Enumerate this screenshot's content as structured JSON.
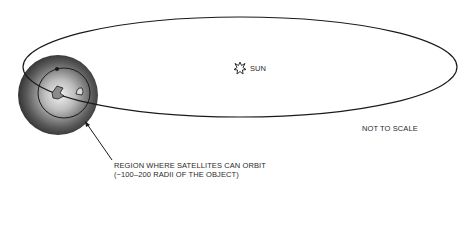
{
  "diagram": {
    "sun_label": "SUN",
    "scale_note": "NOT TO SCALE",
    "region_label_line1": "REGION WHERE SATELLITES CAN ORBIT",
    "region_label_line2": "(~100–200 RADII OF THE OBJECT)",
    "elements": {
      "orbit": "large elliptical orbit around the Sun",
      "object": "shaded sphere representing the satellite region around the orbiting object",
      "satellite_orbit": "small inner orbit with two bodies",
      "sun_icon": "star-burst symbol"
    },
    "colors": {
      "line": "#1a1a1a",
      "sphere_center": "#f0f0f0",
      "sphere_edge": "#2a2a2a"
    }
  }
}
